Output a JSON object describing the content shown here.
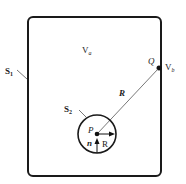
{
  "diagram": {
    "outer_surface_label": "S",
    "outer_surface_sub": "1",
    "inner_surface_label": "S",
    "inner_surface_sub": "2",
    "region_a_label": "V",
    "region_a_sub": "a",
    "region_b_label": "V",
    "region_b_sub": "b",
    "point_q_label": "Q",
    "point_p_label": "P",
    "vector_R_label": "R",
    "normal_label": "n",
    "radius_label": "R",
    "colors": {
      "stroke": "#1a1a1a",
      "line": "#555555",
      "background": "#ffffff"
    }
  }
}
